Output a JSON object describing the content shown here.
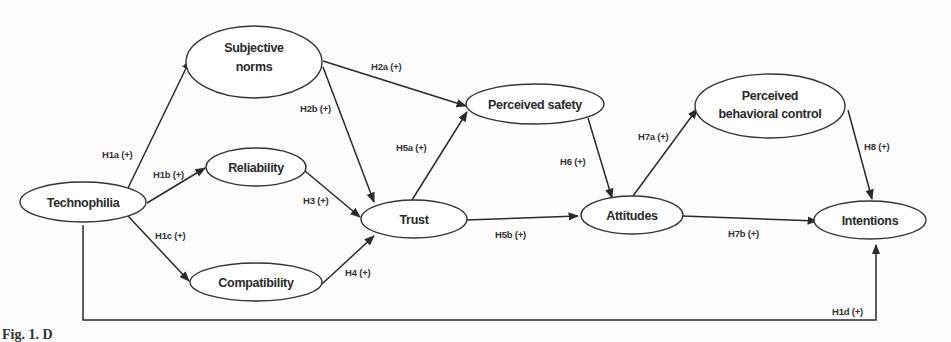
{
  "caption": "Fig. 1. D",
  "nodes": {
    "technophilia": {
      "label": "Technophilia"
    },
    "subjective_norms": {
      "line1": "Subjective",
      "line2": "norms"
    },
    "reliability": {
      "label": "Reliability"
    },
    "compatibility": {
      "label": "Compatibility"
    },
    "trust": {
      "label": "Trust"
    },
    "perceived_safety": {
      "label": "Perceived safety"
    },
    "attitudes": {
      "label": "Attitudes"
    },
    "perceived_behavioral_control": {
      "line1": "Perceived",
      "line2": "behavioral control"
    },
    "intentions": {
      "label": "Intentions"
    }
  },
  "edges": [
    {
      "id": "H1a",
      "label": "H1a (+)",
      "from": "Technophilia",
      "to": "Subjective norms"
    },
    {
      "id": "H1b",
      "label": "H1b (+)",
      "from": "Technophilia",
      "to": "Reliability"
    },
    {
      "id": "H1c",
      "label": "H1c (+)",
      "from": "Technophilia",
      "to": "Compatibility"
    },
    {
      "id": "H1d",
      "label": "H1d (+)",
      "from": "Technophilia",
      "to": "Intentions"
    },
    {
      "id": "H2a",
      "label": "H2a (+)",
      "from": "Subjective norms",
      "to": "Perceived safety"
    },
    {
      "id": "H2b",
      "label": "H2b (+)",
      "from": "Subjective norms",
      "to": "Trust"
    },
    {
      "id": "H3",
      "label": "H3 (+)",
      "from": "Reliability",
      "to": "Trust"
    },
    {
      "id": "H4",
      "label": "H4 (+)",
      "from": "Compatibility",
      "to": "Trust"
    },
    {
      "id": "H5a",
      "label": "H5a (+)",
      "from": "Trust",
      "to": "Perceived safety"
    },
    {
      "id": "H5b",
      "label": "H5b (+)",
      "from": "Trust",
      "to": "Attitudes"
    },
    {
      "id": "H6",
      "label": "H6 (+)",
      "from": "Perceived safety",
      "to": "Attitudes"
    },
    {
      "id": "H7a",
      "label": "H7a (+)",
      "from": "Attitudes",
      "to": "Perceived behavioral control"
    },
    {
      "id": "H7b",
      "label": "H7b (+)",
      "from": "Attitudes",
      "to": "Intentions"
    },
    {
      "id": "H8",
      "label": "H8 (+)",
      "from": "Perceived behavioral control",
      "to": "Intentions"
    }
  ]
}
